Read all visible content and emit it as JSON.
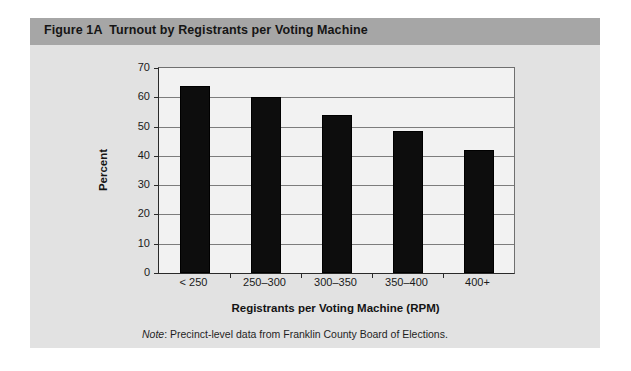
{
  "figure": {
    "title": "Figure 1A  Turnout by Registrants per Voting Machine",
    "note_label": "Note",
    "note_text": ": Precinct-level data from Franklin County Board of Elections.",
    "panel_bg": "#e2e2e2",
    "title_band_color": "#a6a6a6",
    "bar_color": "#0d0d0d",
    "plot_bg": "#f2f2f2",
    "gridline_color": "#7d7d7d",
    "axis_color": "#2a2a2a"
  },
  "chart_data": {
    "type": "bar",
    "title": "Figure 1A  Turnout by Registrants per Voting Machine",
    "xlabel": "Registrants per Voting Machine (RPM)",
    "ylabel": "Percent",
    "categories": [
      "< 250",
      "250–300",
      "300–350",
      "350–400",
      "400+"
    ],
    "values": [
      64,
      60,
      54,
      48.5,
      42
    ],
    "ylim": [
      0,
      70
    ],
    "ytick_step": 10,
    "yticks": [
      0,
      10,
      20,
      30,
      40,
      50,
      60,
      70
    ],
    "ytick_labels": [
      "0",
      "10",
      "20",
      "30",
      "40",
      "50",
      "60",
      "70"
    ],
    "grid": true,
    "grid_axis": "y",
    "legend": false,
    "legend_position": "none",
    "series": [
      {
        "name": "Turnout",
        "values": [
          64,
          60,
          54,
          48.5,
          42
        ]
      }
    ]
  }
}
